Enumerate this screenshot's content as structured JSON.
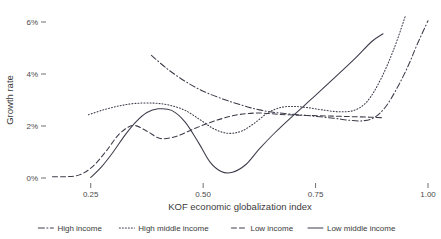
{
  "chart_data": {
    "type": "line",
    "title": "",
    "xlabel": "KOF economic globalization index",
    "ylabel": "Growth rate",
    "xlim": [
      0.155,
      1.0
    ],
    "ylim": [
      -0.3,
      6.6
    ],
    "grid": false,
    "legend_position": "bottom",
    "xticks": [
      0.25,
      0.5,
      0.75,
      1.0
    ],
    "xtick_labels": [
      "0.25",
      "0.50",
      "0.75",
      "1.00"
    ],
    "yticks": [
      0,
      2,
      4,
      6
    ],
    "ytick_labels": [
      "0%",
      "2%",
      "4%",
      "6%"
    ],
    "series": [
      {
        "name": "High income",
        "dash": "dashdot",
        "color": "#3c3c4a",
        "x": [
          0.385,
          0.42,
          0.46,
          0.5,
          0.545,
          0.59,
          0.625,
          0.66,
          0.7,
          0.745,
          0.79,
          0.825,
          0.855,
          0.88,
          0.905,
          0.93,
          0.955,
          0.975,
          1.0
        ],
        "y": [
          4.72,
          4.2,
          3.72,
          3.34,
          3.03,
          2.78,
          2.62,
          2.52,
          2.45,
          2.38,
          2.3,
          2.22,
          2.2,
          2.32,
          2.72,
          3.42,
          4.28,
          5.1,
          6.05
        ]
      },
      {
        "name": "High middle income",
        "dash": "dotted",
        "color": "#3c3c4a",
        "x": [
          0.245,
          0.28,
          0.315,
          0.35,
          0.39,
          0.425,
          0.46,
          0.495,
          0.525,
          0.555,
          0.585,
          0.615,
          0.645,
          0.675,
          0.705,
          0.735,
          0.765,
          0.8,
          0.835,
          0.865,
          0.895,
          0.925,
          0.95
        ],
        "y": [
          2.43,
          2.63,
          2.78,
          2.87,
          2.88,
          2.8,
          2.6,
          2.22,
          1.88,
          1.72,
          1.8,
          2.12,
          2.52,
          2.72,
          2.75,
          2.7,
          2.62,
          2.55,
          2.6,
          2.95,
          3.8,
          5.0,
          6.25
        ]
      },
      {
        "name": "Low income",
        "dash": "dashed",
        "color": "#3c3c4a",
        "x": [
          0.165,
          0.195,
          0.225,
          0.255,
          0.285,
          0.315,
          0.345,
          0.375,
          0.405,
          0.44,
          0.475,
          0.51,
          0.545,
          0.58,
          0.62,
          0.66,
          0.7,
          0.745,
          0.79,
          0.83,
          0.87,
          0.9
        ],
        "y": [
          0.05,
          0.05,
          0.12,
          0.45,
          1.05,
          1.72,
          2.02,
          1.8,
          1.52,
          1.6,
          1.86,
          2.1,
          2.3,
          2.44,
          2.5,
          2.46,
          2.42,
          2.4,
          2.38,
          2.36,
          2.34,
          2.32
        ]
      },
      {
        "name": "Low middle income",
        "dash": "solid",
        "color": "#3c3c4a",
        "x": [
          0.25,
          0.275,
          0.3,
          0.325,
          0.35,
          0.375,
          0.4,
          0.43,
          0.46,
          0.49,
          0.515,
          0.54,
          0.565,
          0.595,
          0.625,
          0.66,
          0.7,
          0.745,
          0.79,
          0.835,
          0.875,
          0.9
        ],
        "y": [
          0.02,
          0.45,
          1.0,
          1.62,
          2.15,
          2.52,
          2.66,
          2.6,
          2.15,
          1.35,
          0.62,
          0.25,
          0.22,
          0.52,
          1.12,
          1.75,
          2.4,
          3.1,
          3.82,
          4.55,
          5.25,
          5.55
        ]
      }
    ]
  },
  "legend": {
    "items": [
      {
        "label": "High income",
        "dash": "dashdot"
      },
      {
        "label": "High middle income",
        "dash": "dotted"
      },
      {
        "label": "Low income",
        "dash": "dashed"
      },
      {
        "label": "Low middle income",
        "dash": "solid"
      }
    ]
  }
}
